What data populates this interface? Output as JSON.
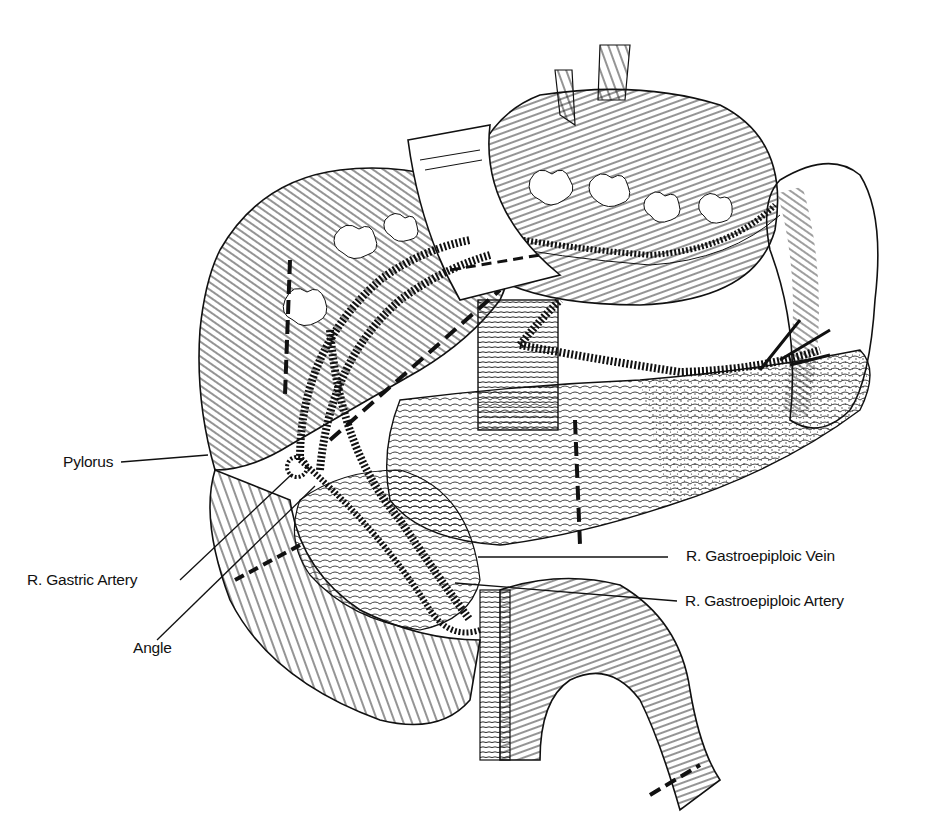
{
  "figure": {
    "ink_color": "#111111",
    "background": "#ffffff"
  },
  "labels": [
    {
      "id": "pylorus",
      "text": "Pylorus",
      "x": 63,
      "y": 453,
      "line": [
        121,
        462,
        208,
        455
      ]
    },
    {
      "id": "r-gastric-artery",
      "text": "R. Gastric Artery",
      "x": 27,
      "y": 571,
      "line": [
        180,
        580,
        292,
        474
      ]
    },
    {
      "id": "angle",
      "text": "Angle",
      "x": 133,
      "y": 648,
      "line": [
        157,
        640,
        315,
        486
      ]
    },
    {
      "id": "r-gastroepiploic-vein",
      "text": "R. Gastroepiploic Vein",
      "x": 686,
      "y": 547,
      "line": [
        478,
        557,
        668,
        557
      ]
    },
    {
      "id": "r-gastroepiploic-artery",
      "text": "R. Gastroepiploic Artery",
      "x": 685,
      "y": 596,
      "line": [
        455,
        583,
        677,
        601
      ]
    }
  ]
}
